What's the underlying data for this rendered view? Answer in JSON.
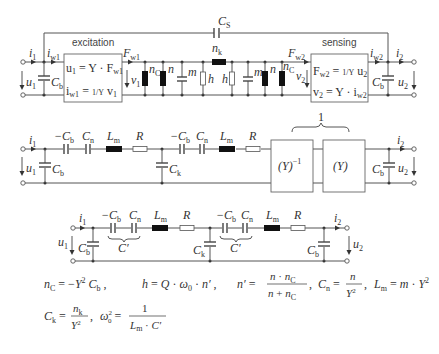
{
  "circuit1": {
    "box_left_label": "excitation",
    "box_right_label": "sensing",
    "coupling_cap": "C",
    "coupling_cap_sub": "S",
    "i1": "i",
    "i1_sub": "1",
    "iw1": "i",
    "iw1_sub": "w1",
    "u1": "u",
    "u1_sub": "1",
    "cb_left": "C",
    "cb_left_sub": "b",
    "eq_left_1": "u₁ = Y · F_w1",
    "eq_left_2": "i_w1 = (1/Y) v₁",
    "fw1": "F",
    "fw1_sub": "w1",
    "v1": "v",
    "v1_sub": "1",
    "nC_left": "n",
    "nC_left_sub": "C",
    "n_left": "n",
    "m_left": "m",
    "h_left": "h",
    "nk": "n",
    "nk_sub": "k",
    "h_right": "h",
    "m_right": "m",
    "n_right": "n",
    "nC_right": "n",
    "nC_right_sub": "C",
    "fw2": "F",
    "fw2_sub": "w2",
    "v2": "v",
    "v2_sub": "2",
    "eq_right_1": "F_w2 = (1/Y) u₂",
    "eq_right_2": "v₂ = Y · i_w2",
    "iw2": "i",
    "iw2_sub": "w2",
    "i2": "i",
    "i2_sub": "2",
    "cb_right": "C",
    "cb_right_sub": "b",
    "u2": "u",
    "u2_sub": "2"
  },
  "circuit2": {
    "i1": "i",
    "i1_sub": "1",
    "u1": "u",
    "u1_sub": "1",
    "cb_left": "C",
    "cb_left_sub": "b",
    "neg_cb_1": "−C",
    "neg_cb_1_sub": "b",
    "cn_1": "C",
    "cn_1_sub": "n",
    "lm_1": "L",
    "lm_1_sub": "m",
    "r_1": "R",
    "ck": "C",
    "ck_sub": "k",
    "neg_cb_2": "−C",
    "neg_cb_2_sub": "b",
    "cn_2": "C",
    "cn_2_sub": "n",
    "lm_2": "L",
    "lm_2_sub": "m",
    "r_2": "R",
    "brace_label": "1",
    "box_inv": "(Y)",
    "box_inv_exp": "−1",
    "box_y": "(Y)",
    "cb_right": "C",
    "cb_right_sub": "b",
    "i2": "i",
    "i2_sub": "2",
    "u2": "u",
    "u2_sub": "2"
  },
  "circuit3": {
    "i1": "i",
    "i1_sub": "1",
    "u1": "u",
    "u1_sub": "1",
    "cb_left": "C",
    "cb_left_sub": "b",
    "neg_cb_1": "−C",
    "neg_cb_1_sub": "b",
    "cn_1": "C",
    "cn_1_sub": "n",
    "cprime_1": "C′",
    "lm_1": "L",
    "lm_1_sub": "m",
    "r_1": "R",
    "ck": "C",
    "ck_sub": "k",
    "neg_cb_2": "−C",
    "neg_cb_2_sub": "b",
    "cn_2": "C",
    "cn_2_sub": "n",
    "cprime_2": "C′",
    "lm_2": "L",
    "lm_2_sub": "m",
    "r_2": "R",
    "cb_right": "C",
    "cb_right_sub": "b",
    "i2": "i",
    "i2_sub": "2",
    "u2": "u",
    "u2_sub": "2"
  },
  "equations": {
    "eq1": "n_C = −Y² C_b",
    "eq2": "h = Q · ω₀ · n′",
    "eq3": "n′ = n · n_C / (n + n_C)",
    "eq4": "C_n = n / Y²",
    "eq5": "L_m = m · Y²",
    "eq6": "C_k = n_k / Y²",
    "eq7": "ω₀² = 1 / (L_m · C′)"
  }
}
